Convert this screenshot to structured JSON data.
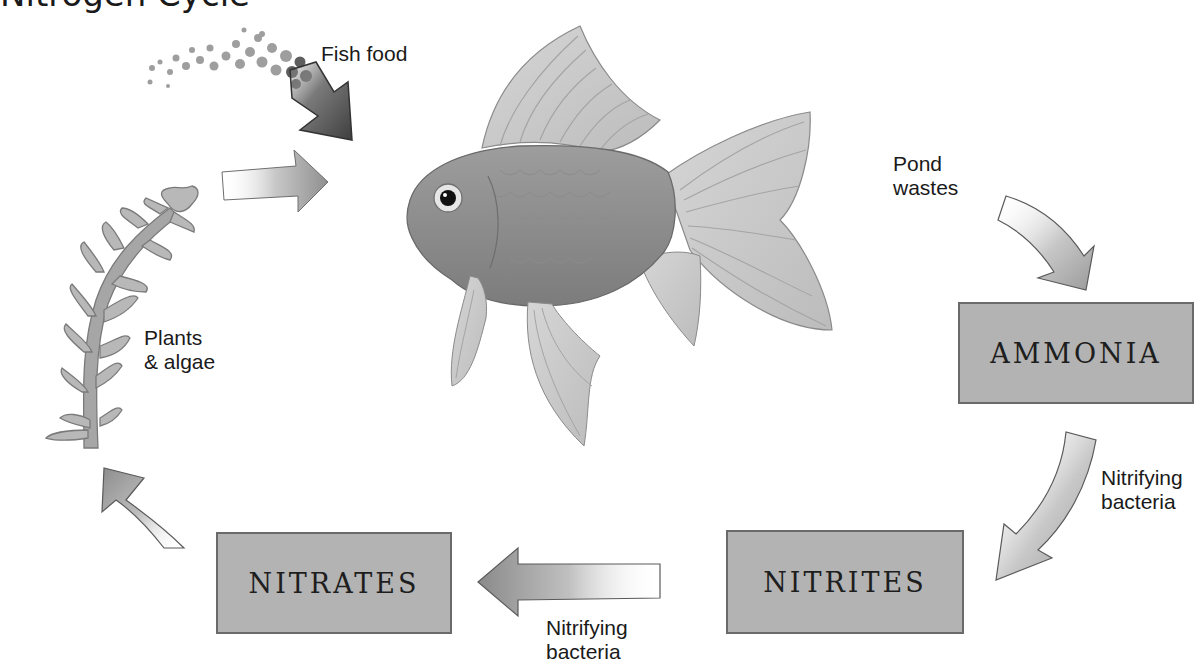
{
  "title_partial": "Nitrogen Cycle",
  "labels": {
    "fish_food": "Fish food",
    "pond_wastes": "Pond\nwastes",
    "nitrifying_right": "Nitrifying\nbacteria",
    "nitrifying_bottom": "Nitrifying\nbacteria",
    "plants_algae": "Plants\n& algae"
  },
  "boxes": {
    "ammonia": "AMMONIA",
    "nitrites": "NITRITES",
    "nitrates": "NITRATES"
  },
  "illustrations": {
    "fish": "goldfish-illustration",
    "plant": "aquatic-plant-illustration",
    "food": "fish-food-pellets"
  },
  "colors": {
    "box_fill": "#b3b3b3",
    "box_border": "#6a6a6a",
    "arrow_fill": "#9a9a9a",
    "arrow_dark": "#4d4d4d",
    "text": "#1a1a1a"
  }
}
